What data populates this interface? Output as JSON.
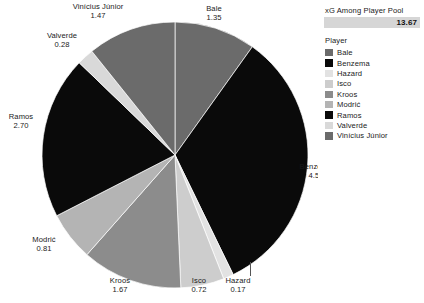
{
  "xg_card": {
    "title": "xG Among Player Pool",
    "value": "13.67",
    "bar_color": "#d6d6d6"
  },
  "legend": {
    "title": "Player",
    "items": [
      {
        "label": "Bale",
        "color": "#6b6b6b"
      },
      {
        "label": "Benzema",
        "color": "#0a0a0a"
      },
      {
        "label": "Hazard",
        "color": "#e2e2e2"
      },
      {
        "label": "Isco",
        "color": "#cdcdcd"
      },
      {
        "label": "Kroos",
        "color": "#8c8c8c"
      },
      {
        "label": "Modrić",
        "color": "#b4b4b4"
      },
      {
        "label": "Ramos",
        "color": "#0a0a0a"
      },
      {
        "label": "Valverde",
        "color": "#d9d9d9"
      },
      {
        "label": "Vinícius Júnior",
        "color": "#6b6b6b"
      }
    ]
  },
  "chart_data": {
    "type": "pie",
    "title": "xG Among Player Pool",
    "total": 13.67,
    "unit": "xG",
    "legend_position": "right",
    "grid": false,
    "start_angle_deg": 0,
    "direction": "clockwise",
    "categories": [
      "Bale",
      "Benzema",
      "Hazard",
      "Isco",
      "Kroos",
      "Modrić",
      "Ramos",
      "Valverde",
      "Vinícius Júnior"
    ],
    "values": [
      1.35,
      4.5,
      0.17,
      0.72,
      1.67,
      0.81,
      2.7,
      0.28,
      1.47
    ],
    "colors": [
      "#6b6b6b",
      "#0a0a0a",
      "#e2e2e2",
      "#cdcdcd",
      "#8c8c8c",
      "#b4b4b4",
      "#0a0a0a",
      "#d9d9d9",
      "#6b6b6b"
    ],
    "slices": [
      {
        "name": "Bale",
        "value": 1.35,
        "value_label": "1.35",
        "color": "#6b6b6b",
        "label_x": 214,
        "label_y": 5,
        "leader": null
      },
      {
        "name": "Benzema",
        "value": 4.5,
        "value_label": "4.50",
        "color": "#0a0a0a",
        "label_x": 316,
        "label_y": 163,
        "leader": null
      },
      {
        "name": "Hazard",
        "value": 0.17,
        "value_label": "0.17",
        "color": "#e2e2e2",
        "label_x": 238,
        "label_y": 277,
        "leader": {
          "x": 250,
          "y": 262,
          "h": 14
        }
      },
      {
        "name": "Isco",
        "value": 0.72,
        "value_label": "0.72",
        "color": "#cdcdcd",
        "label_x": 199,
        "label_y": 277,
        "leader": null
      },
      {
        "name": "Kroos",
        "value": 1.67,
        "value_label": "1.67",
        "color": "#8c8c8c",
        "label_x": 120,
        "label_y": 277,
        "leader": null
      },
      {
        "name": "Modrić",
        "value": 0.81,
        "value_label": "0.81",
        "color": "#b4b4b4",
        "label_x": 44,
        "label_y": 236,
        "leader": null
      },
      {
        "name": "Ramos",
        "value": 2.7,
        "value_label": "2.70",
        "color": "#0a0a0a",
        "label_x": 21,
        "label_y": 113,
        "leader": null
      },
      {
        "name": "Valverde",
        "value": 0.28,
        "value_label": "0.28",
        "color": "#d9d9d9",
        "label_x": 62,
        "label_y": 32,
        "leader": null
      },
      {
        "name": "Vinícius Júnior",
        "value": 1.47,
        "value_label": "1.47",
        "color": "#6b6b6b",
        "label_x": 98,
        "label_y": 3,
        "leader": null
      }
    ],
    "geometry": {
      "cx": 175,
      "cy": 155,
      "r": 133
    }
  }
}
